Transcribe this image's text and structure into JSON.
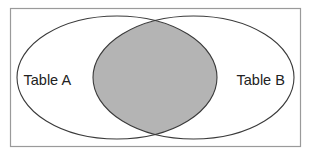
{
  "diagram": {
    "type": "venn",
    "colors": {
      "background": "#ffffff",
      "frame": "#9a9a9a",
      "outline": "#3a3a3a",
      "intersection_fill": "#b4b4b4",
      "text": "#222222"
    },
    "sets": [
      {
        "label": "Table A",
        "cx": 117,
        "cy": 77.5,
        "rx": 100,
        "ry": 61.5
      },
      {
        "label": "Table B",
        "cx": 193.5,
        "cy": 77.5,
        "rx": 100.5,
        "ry": 61.5
      }
    ],
    "shaded_region": "intersection"
  }
}
